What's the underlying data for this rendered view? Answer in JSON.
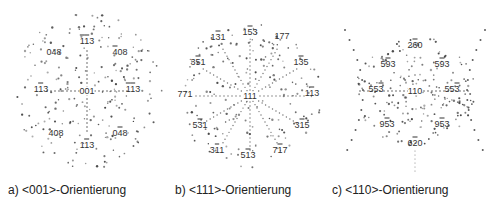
{
  "panels": [
    {
      "id": "a",
      "caption": "a) <001>-Orientierung",
      "center_label": "001",
      "labels": [
        {
          "text": "113",
          "bars": [
            0,
            1
          ],
          "x": 87,
          "y": 41
        },
        {
          "text": "048",
          "bars": [],
          "x": 54,
          "y": 52
        },
        {
          "text": "408",
          "bars": [
            0
          ],
          "x": 120,
          "y": 52
        },
        {
          "text": "113",
          "bars": [
            1
          ],
          "x": 41,
          "y": 89
        },
        {
          "text": "113",
          "bars": [
            0,
            1
          ],
          "x": 133,
          "y": 89
        },
        {
          "text": "408",
          "bars": [],
          "x": 56,
          "y": 133
        },
        {
          "text": "048",
          "bars": [
            1
          ],
          "x": 120,
          "y": 133
        },
        {
          "text": "113",
          "bars": [
            1
          ],
          "x": 87,
          "y": 145
        }
      ]
    },
    {
      "id": "b",
      "caption": "b) <111>-Orientierung",
      "center_label": "111",
      "labels": [
        {
          "text": "153",
          "bars": [
            1
          ],
          "x": 90,
          "y": 32
        },
        {
          "text": "131",
          "bars": [
            1
          ],
          "x": 58,
          "y": 37
        },
        {
          "text": "177",
          "bars": [],
          "x": 122,
          "y": 36
        },
        {
          "text": "351",
          "bars": [
            1
          ],
          "x": 38,
          "y": 62
        },
        {
          "text": "135",
          "bars": [
            1
          ],
          "x": 141,
          "y": 62
        },
        {
          "text": "771",
          "bars": [],
          "x": 25,
          "y": 94
        },
        {
          "text": "113",
          "bars": [
            1
          ],
          "x": 152,
          "y": 93
        },
        {
          "text": "531",
          "bars": [
            1
          ],
          "x": 40,
          "y": 125
        },
        {
          "text": "315",
          "bars": [
            1
          ],
          "x": 142,
          "y": 125
        },
        {
          "text": "311",
          "bars": [
            1
          ],
          "x": 57,
          "y": 150
        },
        {
          "text": "513",
          "bars": [
            1
          ],
          "x": 88,
          "y": 155
        },
        {
          "text": "717",
          "bars": [
            1
          ],
          "x": 120,
          "y": 150
        }
      ]
    },
    {
      "id": "c",
      "caption": "c) <110>-Orientierung",
      "center_label": "110",
      "labels": [
        {
          "text": "260",
          "bars": [
            1
          ],
          "x": 95,
          "y": 45
        },
        {
          "text": "593",
          "bars": [
            1
          ],
          "x": 68,
          "y": 64
        },
        {
          "text": "593",
          "bars": [
            1
          ],
          "x": 122,
          "y": 64
        },
        {
          "text": "553",
          "bars": [
            2
          ],
          "x": 56,
          "y": 89
        },
        {
          "text": "553",
          "bars": [
            2
          ],
          "x": 132,
          "y": 89
        },
        {
          "text": "953",
          "bars": [
            1
          ],
          "x": 67,
          "y": 124
        },
        {
          "text": "953",
          "bars": [
            1
          ],
          "x": 122,
          "y": 124
        },
        {
          "text": "620",
          "bars": [
            1
          ],
          "x": 95,
          "y": 143
        }
      ]
    }
  ],
  "colors": {
    "dot": "#333333",
    "label": "#333333",
    "caption": "#222222"
  }
}
